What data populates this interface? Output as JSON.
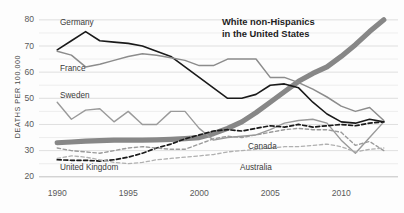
{
  "chart_data": {
    "type": "line",
    "title": "",
    "annotation": {
      "line1": "White non-Hispanics",
      "line2": "in the United States"
    },
    "xlabel": "",
    "ylabel": "DEATHS PER 100,000",
    "xlim": [
      1989,
      2014
    ],
    "ylim": [
      18,
      83
    ],
    "grid": true,
    "grid_step": 5,
    "legend_position": "inline-labels",
    "xticks": [
      1990,
      1995,
      2000,
      2005,
      2010
    ],
    "xtick_labels": [
      "1990",
      "1995",
      "2000",
      "2005",
      "2010"
    ],
    "yticks": [
      20,
      30,
      40,
      50,
      60,
      70,
      80
    ],
    "ytick_labels": [
      "20",
      "30",
      "40",
      "50",
      "60",
      "70",
      "80"
    ],
    "x": [
      1990,
      1991,
      1992,
      1993,
      1994,
      1995,
      1996,
      1997,
      1998,
      1999,
      2000,
      2001,
      2002,
      2003,
      2004,
      2005,
      2006,
      2007,
      2008,
      2009,
      2010,
      2011,
      2012,
      2013
    ],
    "series": [
      {
        "name": "White non-Hispanics in the United States",
        "label": "White non-Hispanics in the United States",
        "color": "#878787",
        "style": "thick-solid",
        "width": 5.2,
        "values": [
          33.0,
          33.3,
          33.6,
          33.8,
          34.0,
          34.0,
          34.0,
          34.1,
          34.3,
          34.6,
          35.0,
          36.5,
          38.5,
          41.0,
          44.5,
          48.5,
          52.5,
          56.5,
          59.5,
          62.0,
          66.0,
          70.5,
          75.5,
          80.0
        ]
      },
      {
        "name": "Germany",
        "label": "Germany",
        "color": "#1a1a1a",
        "style": "solid",
        "width": 1.6,
        "values": [
          68.5,
          72.0,
          75.5,
          72.0,
          71.5,
          71.0,
          70.0,
          68.0,
          66.0,
          62.0,
          58.0,
          54.0,
          50.0,
          50.0,
          51.5,
          55.0,
          55.5,
          54.0,
          48.5,
          44.0,
          41.0,
          40.5,
          42.0,
          41.0
        ]
      },
      {
        "name": "France",
        "label": "France",
        "color": "#8c8c8c",
        "style": "solid",
        "width": 1.5,
        "values": [
          68.0,
          66.5,
          62.0,
          63.0,
          64.5,
          66.0,
          67.0,
          66.5,
          65.5,
          64.5,
          62.5,
          62.5,
          65.0,
          65.0,
          65.0,
          58.0,
          58.0,
          56.0,
          53.5,
          50.5,
          47.0,
          45.0,
          46.5,
          41.5
        ]
      },
      {
        "name": "Sweden",
        "label": "Sweden",
        "color": "#9a9a9a",
        "style": "solid",
        "width": 1.4,
        "values": [
          48.5,
          42.0,
          45.5,
          46.0,
          41.0,
          45.0,
          40.0,
          40.0,
          45.0,
          45.0,
          38.5,
          34.0,
          35.0,
          35.5,
          36.0,
          38.0,
          40.5,
          41.5,
          42.0,
          40.5,
          34.0,
          29.0,
          35.0,
          41.0
        ]
      },
      {
        "name": "United Kingdom",
        "label": "United Kingdom",
        "color": "#1a1a1a",
        "style": "dashed",
        "width": 1.7,
        "values": [
          26.5,
          26.3,
          26.3,
          26.0,
          26.5,
          27.5,
          29.0,
          31.0,
          32.5,
          34.5,
          36.0,
          37.5,
          38.0,
          37.5,
          38.5,
          39.5,
          39.0,
          40.0,
          39.0,
          39.5,
          40.0,
          39.5,
          40.5,
          41.0
        ]
      },
      {
        "name": "Canada",
        "label": "Canada",
        "color": "#9a9a9a",
        "style": "dashed",
        "width": 1.4,
        "values": [
          31.0,
          30.0,
          29.5,
          29.0,
          30.0,
          31.0,
          31.5,
          31.0,
          30.5,
          30.5,
          32.5,
          34.5,
          35.5,
          35.0,
          36.0,
          37.0,
          38.0,
          38.5,
          38.0,
          38.0,
          37.0,
          32.0,
          33.5,
          30.0
        ]
      },
      {
        "name": "Australia",
        "label": "Australia",
        "color": "#b0b0b0",
        "style": "dashed",
        "width": 1.3,
        "values": [
          27.0,
          28.0,
          27.5,
          26.5,
          25.5,
          25.0,
          25.5,
          26.5,
          27.0,
          27.5,
          28.0,
          28.5,
          29.5,
          30.0,
          30.5,
          31.0,
          31.5,
          31.5,
          32.0,
          32.5,
          31.5,
          29.5,
          30.5,
          31.0
        ]
      }
    ]
  }
}
